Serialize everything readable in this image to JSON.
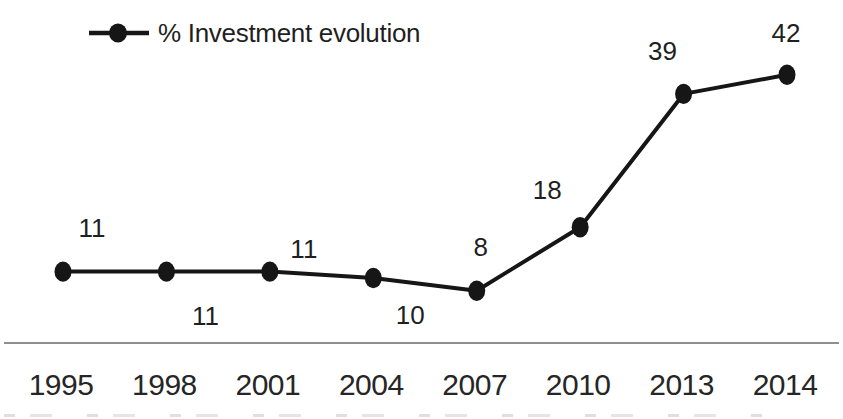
{
  "legend": {
    "series_label": "% Investment evolution",
    "marker": "filled-circle-on-line"
  },
  "chart_data": {
    "type": "line",
    "title": "",
    "xlabel": "",
    "ylabel": "",
    "categories": [
      "1995",
      "1998",
      "2001",
      "2004",
      "2007",
      "2010",
      "2013",
      "2014"
    ],
    "series": [
      {
        "name": "% Investment evolution",
        "values": [
          11,
          11,
          11,
          10,
          8,
          18,
          39,
          42
        ]
      }
    ],
    "data_labels": [
      "11",
      "11",
      "11",
      "10",
      "8",
      "18",
      "39",
      "42"
    ],
    "ylim": [
      0,
      47
    ],
    "grid": false,
    "y_axis_visible": false,
    "x_axis_visible": true,
    "legend_position": "top-left",
    "marker_style": "filled-circle",
    "label_offsets": [
      [
        29,
        -44
      ],
      [
        39,
        44
      ],
      [
        34,
        -23
      ],
      [
        37,
        37
      ],
      [
        4,
        -44
      ],
      [
        -33,
        -37
      ],
      [
        -21,
        -43
      ],
      [
        -1,
        -42
      ]
    ],
    "colors": {
      "line": "#161616",
      "marker": "#161616",
      "data_label_text": "#1f1f1f",
      "tick_label_text": "#262626",
      "axis_line": "#8f8f8f",
      "background": "#ffffff"
    }
  }
}
